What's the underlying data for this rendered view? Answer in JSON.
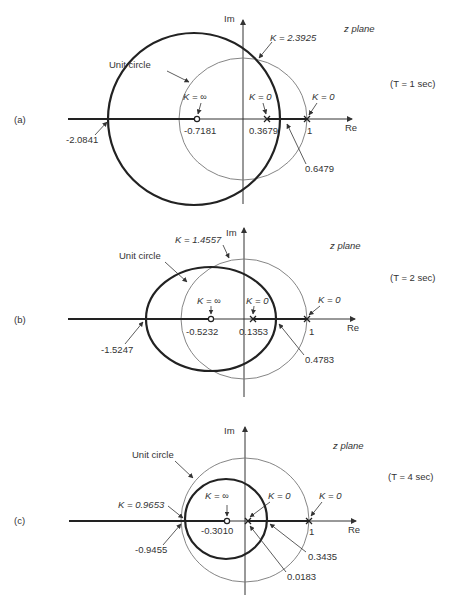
{
  "figure": {
    "panels": [
      {
        "id": "a",
        "panel_label": "(a)",
        "plane_label": "z plane",
        "period_label": "(T = 1 sec)",
        "axis_labels": {
          "re": "Re",
          "im": "Im"
        },
        "unit_circle_label": "Unit circle",
        "zero": {
          "value": -0.7181,
          "label": "-0.7181",
          "gain_label": "K = ∞"
        },
        "poles": [
          {
            "value": 0.3679,
            "label": "0.3679",
            "gain_label": "K = 0"
          },
          {
            "value": 1,
            "label": "1",
            "gain_label": "K = 0"
          }
        ],
        "breakaway_points": [
          {
            "value": -2.0841,
            "label": "-2.0841"
          },
          {
            "value": 0.6479,
            "label": "0.6479"
          }
        ],
        "crossing_gain_label": "K = 2.3925"
      },
      {
        "id": "b",
        "panel_label": "(b)",
        "plane_label": "z plane",
        "period_label": "(T = 2 sec)",
        "axis_labels": {
          "re": "Re",
          "im": "Im"
        },
        "unit_circle_label": "Unit circle",
        "zero": {
          "value": -0.5232,
          "label": "-0.5232",
          "gain_label": "K = ∞"
        },
        "poles": [
          {
            "value": 0.1353,
            "label": "0.1353",
            "gain_label": "K = 0"
          },
          {
            "value": 1,
            "label": "1",
            "gain_label": "K = 0"
          }
        ],
        "breakaway_points": [
          {
            "value": -1.5247,
            "label": "-1.5247"
          },
          {
            "value": 0.4783,
            "label": "0.4783"
          }
        ],
        "crossing_gain_label": "K = 1.4557"
      },
      {
        "id": "c",
        "panel_label": "(c)",
        "plane_label": "z plane",
        "period_label": "(T = 4 sec)",
        "axis_labels": {
          "re": "Re",
          "im": "Im"
        },
        "unit_circle_label": "Unit circle",
        "zero": {
          "value": -0.301,
          "label": "-0.3010",
          "gain_label": "K = ∞"
        },
        "poles": [
          {
            "value": 0.0183,
            "label": "0.0183",
            "gain_label": "K = 0"
          },
          {
            "value": 1,
            "label": "1",
            "gain_label": "K = 0"
          }
        ],
        "breakaway_points": [
          {
            "value": -0.9455,
            "label": "-0.9455"
          },
          {
            "value": 0.3435,
            "label": "0.3435"
          }
        ],
        "crossing_gain_label": "K = 0.9653"
      }
    ]
  },
  "colors": {
    "locus": "#222222",
    "unit_circle": "#777777",
    "axis": "#333333",
    "background": "#ffffff"
  }
}
